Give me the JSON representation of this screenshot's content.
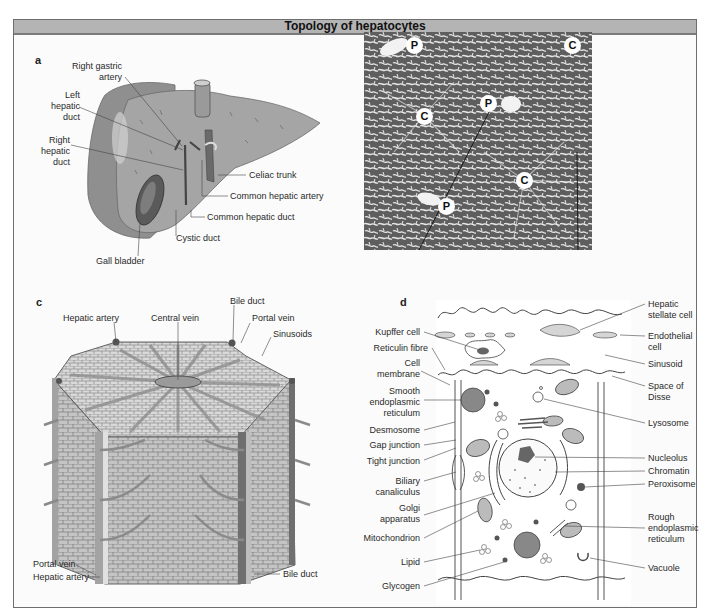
{
  "figure": {
    "title": "Topology of hepatocytes",
    "colors": {
      "header_bg": "#b4b4b4",
      "header_rule": "#7a7a7a",
      "frame": "#6e6e6e",
      "panel_bg": "#fbfbfb"
    }
  },
  "panel_a": {
    "letter": "a",
    "labels": {
      "right_gastric_artery_1": "Right gastric",
      "right_gastric_artery_2": "artery",
      "left_hepatic_duct_1": "Left",
      "left_hepatic_duct_2": "hepatic",
      "left_hepatic_duct_3": "duct",
      "right_hepatic_duct_1": "Right",
      "right_hepatic_duct_2": "hepatic",
      "right_hepatic_duct_3": "duct",
      "celiac_trunk": "Celiac trunk",
      "common_hepatic_artery": "Common hepatic artery",
      "common_hepatic_duct": "Common hepatic duct",
      "cystic_duct": "Cystic duct",
      "gall_bladder": "Gall bladder"
    }
  },
  "panel_b": {
    "letter": "b",
    "markers": [
      "P",
      "C",
      "P",
      "C",
      "C",
      "P"
    ]
  },
  "panel_c": {
    "letter": "c",
    "labels": {
      "hepatic_artery_top": "Hepatic artery",
      "central_vein": "Central vein",
      "bile_duct_top": "Bile duct",
      "portal_vein_top": "Portal vein",
      "sinusoids": "Sinusoids",
      "portal_vein_bottom": "Portal vein",
      "hepatic_artery_bottom": "Hepatic artery",
      "bile_duct_bottom": "Bile duct"
    }
  },
  "panel_d": {
    "letter": "d",
    "left_labels": {
      "kupffer_cell": "Kupffer cell",
      "reticulin_fibre": "Reticulin fibre",
      "cell_membrane_1": "Cell",
      "cell_membrane_2": "membrane",
      "ser_1": "Smooth",
      "ser_2": "endoplasmic",
      "ser_3": "reticulum",
      "desmosome": "Desmosome",
      "gap_junction": "Gap junction",
      "tight_junction": "Tight junction",
      "biliary_1": "Biliary",
      "biliary_2": "canaliculus",
      "golgi_1": "Golgi",
      "golgi_2": "apparatus",
      "mitochondrion": "Mitochondrion",
      "lipid": "Lipid",
      "glycogen": "Glycogen"
    },
    "right_labels": {
      "hsc_1": "Hepatic",
      "hsc_2": "stellate cell",
      "endothelial_1": "Endothelial",
      "endothelial_2": "cell",
      "sinusoid": "Sinusoid",
      "disse_1": "Space of",
      "disse_2": "Disse",
      "lysosome": "Lysosome",
      "nucleolus": "Nucleolus",
      "chromatin": "Chromatin",
      "peroxisome": "Peroxisome",
      "rer_1": "Rough",
      "rer_2": "endoplasmic",
      "rer_3": "reticulum",
      "vacuole": "Vacuole"
    }
  }
}
